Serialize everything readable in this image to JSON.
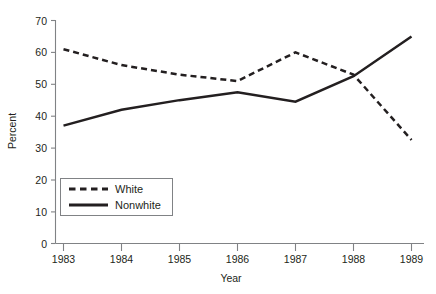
{
  "chart_data": {
    "type": "line",
    "title": "",
    "xlabel": "Year",
    "ylabel": "Percent",
    "x": [
      1983,
      1984,
      1985,
      1986,
      1987,
      1988,
      1989
    ],
    "xticklabels": [
      "1983",
      "1984",
      "1985",
      "1986",
      "1987",
      "1988",
      "1989"
    ],
    "yticks": [
      0,
      10,
      20,
      30,
      40,
      50,
      60,
      70
    ],
    "yticklabels": [
      "0",
      "10",
      "20",
      "30",
      "40",
      "50",
      "60",
      "70"
    ],
    "ylim": [
      0,
      70
    ],
    "xlim": [
      1983,
      1989
    ],
    "grid": false,
    "legend_position": "lower left",
    "series": [
      {
        "name": "White",
        "style": "dashed",
        "color": "#231f20",
        "values": [
          61,
          56,
          53,
          51,
          60,
          53,
          32.5
        ]
      },
      {
        "name": "Nonwhite",
        "style": "solid",
        "color": "#231f20",
        "values": [
          37,
          42,
          45,
          47.5,
          44.5,
          52.5,
          65
        ]
      }
    ]
  },
  "legend": {
    "items": [
      {
        "label": "White"
      },
      {
        "label": "Nonwhite"
      }
    ]
  },
  "axes": {
    "y_title": "Percent",
    "x_title": "Year"
  }
}
